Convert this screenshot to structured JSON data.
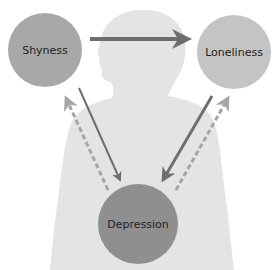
{
  "diagram": {
    "type": "cycle-relationship",
    "background_figure": "woman-silhouette",
    "nodes": [
      {
        "id": "shyness",
        "label": "Shyness",
        "cx": 45,
        "cy": 50,
        "r": 37,
        "color": "#a8a8a8"
      },
      {
        "id": "loneliness",
        "label": "Loneliness",
        "cx": 234,
        "cy": 52,
        "r": 37,
        "color": "#c4c4c4"
      },
      {
        "id": "depression",
        "label": "Depression",
        "cx": 138,
        "cy": 224,
        "r": 40,
        "color": "#8f8f8f"
      }
    ],
    "edges": [
      {
        "from": "shyness",
        "to": "loneliness",
        "style": "solid"
      },
      {
        "from": "shyness",
        "to": "depression",
        "style": "solid"
      },
      {
        "from": "loneliness",
        "to": "depression",
        "style": "solid"
      },
      {
        "from": "depression",
        "to": "shyness",
        "style": "dashed"
      },
      {
        "from": "depression",
        "to": "loneliness",
        "style": "dashed"
      }
    ],
    "colors": {
      "solid_arrow": "#6e6e6e",
      "dashed_arrow": "#a5a5a5",
      "silhouette": "#e4e4e4",
      "label_text": "#222222"
    }
  }
}
